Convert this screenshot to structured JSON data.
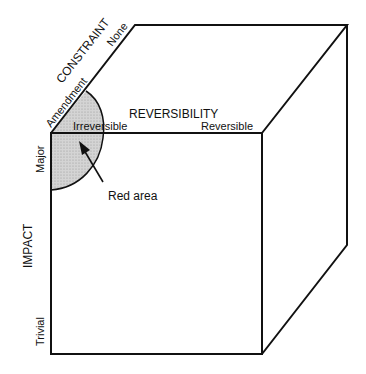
{
  "diagram": {
    "type": "3d-cube-framework",
    "axes": {
      "constraint": {
        "label": "CONSTRAINT",
        "low": "Amendment",
        "high": "None"
      },
      "reversibility": {
        "label": "REVERSIBILITY",
        "low": "Irreversible",
        "high": "Reversible"
      },
      "impact": {
        "label": "IMPACT",
        "low": "Trivial",
        "high": "Major"
      }
    },
    "annotation": {
      "label": "Red area"
    },
    "colors": {
      "line": "#111111",
      "shaded_area": "#cccccc",
      "background": "#ffffff"
    }
  }
}
